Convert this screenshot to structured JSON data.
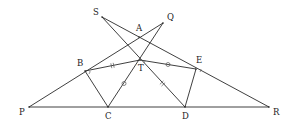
{
  "diagram": {
    "type": "geometry",
    "points": [
      {
        "name": "S",
        "x": 102,
        "y": 17,
        "label_dx": -9,
        "label_dy": -2
      },
      {
        "name": "Q",
        "x": 163,
        "y": 23,
        "label_dx": 4,
        "label_dy": -3
      },
      {
        "name": "A",
        "x": 139,
        "y": 37,
        "label_dx": -3,
        "label_dy": -6
      },
      {
        "name": "B",
        "x": 85,
        "y": 71,
        "label_dx": -8,
        "label_dy": -5
      },
      {
        "name": "T",
        "x": 140,
        "y": 60,
        "label_dx": -2,
        "label_dy": 11
      },
      {
        "name": "E",
        "x": 196,
        "y": 69,
        "label_dx": 0,
        "label_dy": -6
      },
      {
        "name": "P",
        "x": 29,
        "y": 107,
        "label_dx": -10,
        "label_dy": 8
      },
      {
        "name": "C",
        "x": 108,
        "y": 107,
        "label_dx": -3,
        "label_dy": 12
      },
      {
        "name": "D",
        "x": 185,
        "y": 107,
        "label_dx": -3,
        "label_dy": 12
      },
      {
        "name": "R",
        "x": 269,
        "y": 107,
        "label_dx": 4,
        "label_dy": 8
      }
    ],
    "segments": [
      [
        "P",
        "Q"
      ],
      [
        "S",
        "R"
      ],
      [
        "P",
        "R"
      ],
      [
        "S",
        "D"
      ],
      [
        "C",
        "Q"
      ],
      [
        "B",
        "T"
      ],
      [
        "T",
        "E"
      ],
      [
        "B",
        "C"
      ],
      [
        "E",
        "D"
      ]
    ],
    "equal_marks": [
      {
        "segment": [
          "B",
          "T"
        ],
        "style": "double-tick"
      },
      {
        "segment": [
          "T",
          "D"
        ],
        "style": "double-tick"
      },
      {
        "segment": [
          "T",
          "E"
        ],
        "style": "circle"
      },
      {
        "segment": [
          "C",
          "T"
        ],
        "style": "circle"
      }
    ],
    "angle_marks": [
      "B",
      "T",
      "E"
    ]
  }
}
